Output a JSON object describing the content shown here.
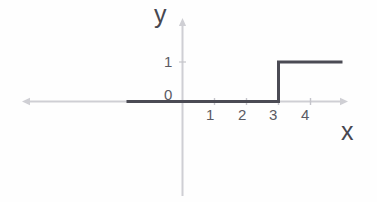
{
  "chart_data": {
    "type": "line",
    "title": "",
    "subtitle": "",
    "xlabel": "x",
    "ylabel": "y",
    "x_tick_labels": [
      "1",
      "2",
      "3",
      "4"
    ],
    "x_tick_values": [
      1,
      2,
      3,
      4
    ],
    "y_tick_labels": [
      "0",
      "1"
    ],
    "y_tick_values": [
      0,
      1
    ],
    "xlim": [
      -5.0,
      5.2
    ],
    "ylim": [
      -2.9,
      4.2
    ],
    "grid": false,
    "legend": false,
    "legend_position": "none",
    "x_axis_arrows": [
      "left",
      "right"
    ],
    "y_axis_arrows": [
      "up"
    ],
    "series": [
      {
        "name": "step",
        "step_type": "post",
        "points": [
          {
            "x": -1.75,
            "y": 0
          },
          {
            "x": 3,
            "y": 0
          },
          {
            "x": 3,
            "y": 1
          },
          {
            "x": 5.0,
            "y": 1
          }
        ],
        "jump_x": 3,
        "value_before_jump": 0,
        "value_after_jump": 1
      }
    ]
  },
  "labels": {
    "y_axis_name": "y",
    "x_axis_name": "x",
    "y_tick_1": "1",
    "y_tick_0": "0",
    "x_tick_1": "1",
    "x_tick_2": "2",
    "x_tick_3": "3",
    "x_tick_4": "4"
  },
  "colors": {
    "background": "#fefefe",
    "axis": "#cfcfd4",
    "axis_tick": "#c4c4ca",
    "curve": "#4b4b54",
    "label": "#474750",
    "tick_label": "#5a5a63"
  }
}
